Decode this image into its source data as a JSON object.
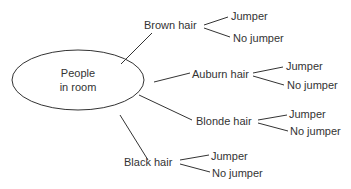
{
  "diagram": {
    "type": "tree",
    "root": {
      "label_line1": "People",
      "label_line2": "in room"
    },
    "branches": [
      {
        "label": "Brown hair",
        "leaves": [
          "Jumper",
          "No jumper"
        ]
      },
      {
        "label": "Auburn hair",
        "leaves": [
          "Jumper",
          "No jumper"
        ]
      },
      {
        "label": "Blonde hair",
        "leaves": [
          "Jumper",
          "No jumper"
        ]
      },
      {
        "label": "Black hair",
        "leaves": [
          "Jumper",
          "No jumper"
        ]
      }
    ],
    "line_color": "#333333"
  }
}
